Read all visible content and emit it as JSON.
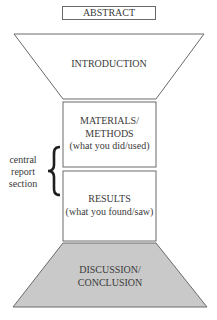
{
  "diagram": {
    "abstract": "ABSTRACT",
    "introduction": "INTRODUCTION",
    "materials": {
      "line1": "MATERIALS/",
      "line2": "METHODS",
      "line3": "(what you did/used)"
    },
    "results": {
      "line1": "RESULTS",
      "line2": "(what you found/saw)"
    },
    "discussion": {
      "line1": "DISCUSSION/",
      "line2": "CONCLUSION"
    },
    "side_label": {
      "line1": "central",
      "line2": "report",
      "line3": "section"
    },
    "colors": {
      "stroke": "#6a6a6a",
      "discussion_fill": "#c9c9c9",
      "text": "#3a3a3a"
    }
  }
}
